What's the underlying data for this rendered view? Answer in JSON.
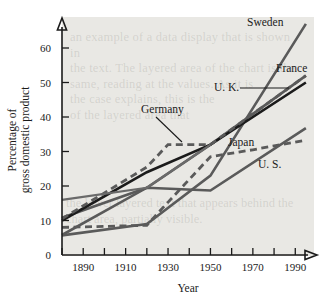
{
  "figure": {
    "background_color": "#e9e8e4",
    "page_background": "#ffffff",
    "axis_color": "#1b1b1b"
  },
  "axes": {
    "ylabel_line1": "Percentage of",
    "ylabel_line2": "gross domestic product",
    "xlabel": "Year",
    "ytick_labels": [
      "0",
      "10",
      "20",
      "30",
      "40",
      "50",
      "60"
    ],
    "xtick_labels": [
      "1890",
      "1910",
      "1930",
      "1950",
      "1970",
      "1990"
    ]
  },
  "series_labels": {
    "sweden": "Sweden",
    "france": "France",
    "uk": "U. K.",
    "germany": "Germany",
    "japan": "Japan",
    "us": "U. S."
  },
  "watermark": {
    "line1": "an example of a data display that is shown in",
    "line2": "the text. The layered area of the chart is the",
    "line3": "same, reading at the values. As it is",
    "line4": "the case explains, this is the",
    "line5": "of the layered area that",
    "lower1": "the lower layered text that appears behind the",
    "lower2": "chart area, partially visible."
  },
  "chart_data": {
    "type": "line",
    "title": "",
    "xlabel": "Year",
    "ylabel": "Percentage of gross domestic product",
    "xlim": [
      1880,
      1996
    ],
    "ylim": [
      0,
      68
    ],
    "xticks": [
      1890,
      1910,
      1930,
      1950,
      1970,
      1990
    ],
    "xminorticks": [
      1880,
      1900,
      1920,
      1940,
      1960,
      1980
    ],
    "yticks": [
      0,
      10,
      20,
      30,
      40,
      50,
      60
    ],
    "grid": false,
    "legend": "inline-labels",
    "series": [
      {
        "name": "Sweden",
        "color": "#5a5a5a",
        "style": "solid",
        "width": 2.6,
        "x": [
          1880,
          1920,
          1950,
          1995
        ],
        "values": [
          5.7,
          9.0,
          23.0,
          67.0
        ]
      },
      {
        "name": "France",
        "color": "#5a5a5a",
        "style": "solid",
        "width": 2.6,
        "x": [
          1880,
          1920,
          1950,
          1995
        ],
        "values": [
          10.8,
          19.5,
          32.0,
          52.0
        ]
      },
      {
        "name": "U. K.",
        "color": "#1b1b1b",
        "style": "solid",
        "width": 2.6,
        "x": [
          1880,
          1920,
          1950,
          1995
        ],
        "values": [
          10.0,
          24.0,
          32.0,
          50.0
        ]
      },
      {
        "name": "Germany",
        "color": "#5a5a5a",
        "style": "dashed",
        "width": 2.8,
        "x": [
          1880,
          1920,
          1930,
          1950,
          1995
        ],
        "values": [
          10.5,
          25.5,
          32.0,
          32.0,
          52.0
        ]
      },
      {
        "name": "Japan",
        "color": "#5a5a5a",
        "style": "dashed",
        "width": 2.8,
        "x": [
          1880,
          1920,
          1925,
          1950,
          1970,
          1995
        ],
        "values": [
          8.0,
          8.6,
          12.0,
          28.5,
          30.5,
          33.3
        ]
      },
      {
        "name": "U. S.",
        "color": "#5a5a5a",
        "style": "solid",
        "width": 2.6,
        "x": [
          1880,
          1920,
          1950,
          1995
        ],
        "values": [
          5.8,
          19.5,
          18.7,
          36.8
        ]
      },
      {
        "name": "France-early",
        "color": "#6a6a6a",
        "style": "solid",
        "width": 2.2,
        "x": [
          1880,
          1920,
          1950
        ],
        "values": [
          16.0,
          19.5,
          32.0
        ]
      }
    ]
  }
}
